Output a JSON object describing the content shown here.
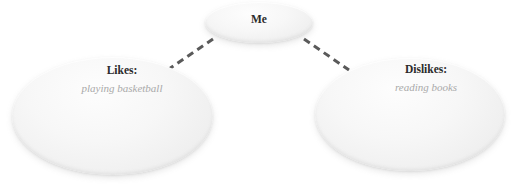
{
  "diagram": {
    "type": "mind-map",
    "background_color": "#ffffff",
    "nodes": [
      {
        "id": "me",
        "title": "Me",
        "detail": "",
        "shape": "ellipse",
        "fill_color": "#f4f4f4",
        "title_color": "#2e2e2e"
      },
      {
        "id": "likes",
        "title": "Likes:",
        "detail": "playing basketball",
        "shape": "ellipse",
        "fill_color": "#f2f2f2",
        "title_color": "#2b2b2b",
        "detail_color": "#a9a9a9"
      },
      {
        "id": "dislikes",
        "title": "Dislikes:",
        "detail": "reading books",
        "shape": "ellipse",
        "fill_color": "#f2f2f2",
        "title_color": "#2b2b2b",
        "detail_color": "#a9a9a9"
      }
    ],
    "edges": [
      {
        "id": "me-to-likes",
        "from": "me",
        "to": "likes",
        "style": "dashed",
        "color": "#5a5a5a"
      },
      {
        "id": "me-to-dislikes",
        "from": "me",
        "to": "dislikes",
        "style": "dashed",
        "color": "#5a5a5a"
      }
    ]
  }
}
